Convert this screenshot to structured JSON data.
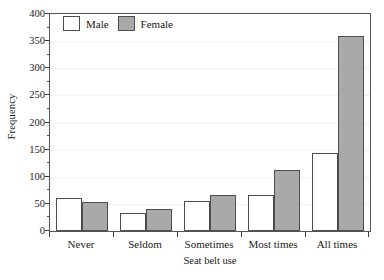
{
  "chart_data": {
    "type": "bar",
    "title": "",
    "xlabel": "Seat belt use",
    "ylabel": "Frequency",
    "categories": [
      "Never",
      "Seldom",
      "Sometimes",
      "Most times",
      "All times"
    ],
    "series": [
      {
        "name": "Male",
        "color": "#ffffff",
        "values": [
          60,
          34,
          56,
          67,
          143
        ]
      },
      {
        "name": "Female",
        "color": "#a9a9a9",
        "values": [
          54,
          40,
          66,
          112,
          360
        ]
      }
    ],
    "ylim": [
      0,
      400
    ],
    "ytick_values": [
      0,
      50,
      100,
      150,
      200,
      250,
      300,
      350,
      400
    ],
    "ytick_labels": [
      "0",
      "50",
      "100",
      "150",
      "200",
      "250",
      "300",
      "350",
      "400"
    ],
    "yminor_values": [
      25,
      75,
      125,
      175,
      225,
      275,
      325,
      375
    ],
    "grid": true,
    "grid_axis": "y",
    "legend_position": "top-left",
    "legend_entries": [
      "Male",
      "Female"
    ],
    "bar_border_color": "#4d4d4d",
    "frame_color": "#555555",
    "grid_color": "#f1f1f1"
  }
}
